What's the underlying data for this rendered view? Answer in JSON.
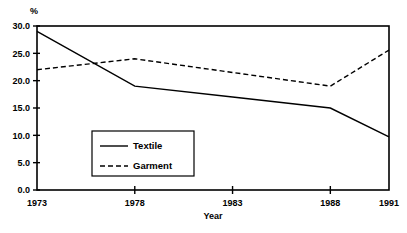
{
  "figure": {
    "cut_title_fragment": "",
    "unit_label": "%"
  },
  "chart_data": {
    "type": "line",
    "title": "",
    "xlabel": "Year",
    "ylabel": "%",
    "x": [
      1973,
      1978,
      1983,
      1988,
      1991
    ],
    "xtick_labels": [
      "1973",
      "1978",
      "1983",
      "1988",
      "1991"
    ],
    "ytick_labels": [
      "0.0",
      "5.0",
      "10.0",
      "15.0",
      "20.0",
      "25.0",
      "30.0"
    ],
    "ytick_values": [
      0.0,
      5.0,
      10.0,
      15.0,
      20.0,
      25.0,
      30.0
    ],
    "xlim": [
      1973,
      1991
    ],
    "ylim": [
      0.0,
      30.0
    ],
    "grid": false,
    "legend_position": "inside-lower-left",
    "series": [
      {
        "name": "Textile",
        "style": "solid",
        "color": "#000000",
        "values": [
          29.0,
          19.0,
          17.0,
          15.0,
          9.7
        ]
      },
      {
        "name": "Garment",
        "style": "dashed",
        "color": "#000000",
        "values": [
          22.0,
          24.0,
          21.5,
          19.0,
          25.6
        ]
      }
    ]
  }
}
